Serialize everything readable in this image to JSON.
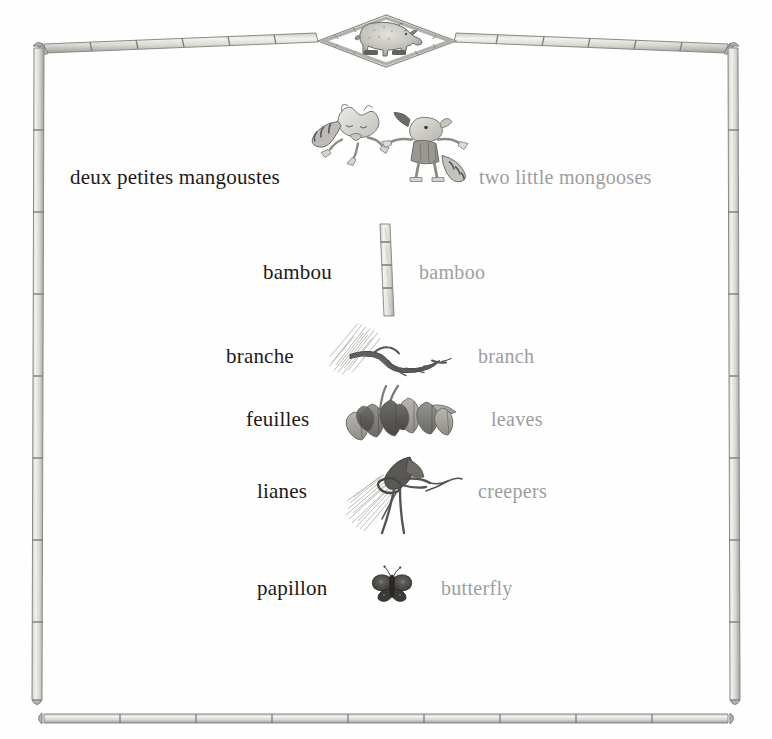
{
  "page": {
    "background_color": "#fefefe",
    "french_text_color": "#1d1a18",
    "english_text_color": "#9d9d9d",
    "frame_color": "#8d8d8a",
    "width": 772,
    "height": 739
  },
  "frame": {
    "style_name": "bamboo-pole-border",
    "corner_icon": "bamboo-corner-joint-icon",
    "segment_icon": "bamboo-node-icon"
  },
  "header": {
    "medallion_name": "rhinoceros-diamond-medallion",
    "animal_icon": "rhinoceros-icon",
    "shape": "diamond"
  },
  "vocabulary": {
    "entries": [
      {
        "french": "deux petites mangoustes",
        "english": "two little mongooses",
        "illustration": "two-mongooses-illustration",
        "fr_x": 70,
        "fr_y": 177,
        "en_x": 479,
        "en_y": 177,
        "art_x": 392,
        "art_y": 158,
        "art_w": 180,
        "art_h": 125
      },
      {
        "french": "bambou",
        "english": "bamboo",
        "illustration": "bamboo-stalk-illustration",
        "fr_x": 263,
        "fr_y": 272,
        "en_x": 419,
        "en_y": 272,
        "art_x": 386,
        "art_y": 270,
        "art_w": 46,
        "art_h": 96
      },
      {
        "french": "branche",
        "english": "branch",
        "illustration": "tree-branch-illustration",
        "fr_x": 226,
        "fr_y": 356,
        "en_x": 478,
        "en_y": 356,
        "art_x": 392,
        "art_y": 350,
        "art_w": 128,
        "art_h": 55
      },
      {
        "french": "feuilles",
        "english": "leaves",
        "illustration": "leaf-cluster-illustration",
        "fr_x": 246,
        "fr_y": 419,
        "en_x": 491,
        "en_y": 419,
        "art_x": 398,
        "art_y": 415,
        "art_w": 132,
        "art_h": 62
      },
      {
        "french": "lianes",
        "english": "creepers",
        "illustration": "creeper-vines-illustration",
        "fr_x": 257,
        "fr_y": 491,
        "en_x": 478,
        "en_y": 491,
        "art_x": 404,
        "art_y": 494,
        "art_w": 120,
        "art_h": 82
      },
      {
        "french": "papillon",
        "english": "butterfly",
        "illustration": "butterfly-illustration",
        "fr_x": 257,
        "fr_y": 588,
        "en_x": 441,
        "en_y": 588,
        "art_x": 392,
        "art_y": 584,
        "art_w": 44,
        "art_h": 42
      }
    ]
  }
}
